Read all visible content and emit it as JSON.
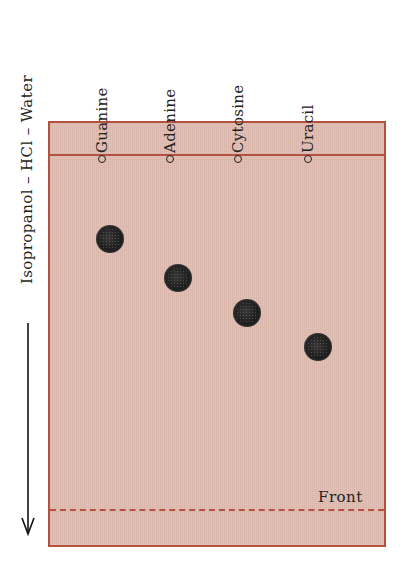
{
  "diagram": {
    "type": "paper chromatography plate",
    "solvent_system": "Isopropanol – HCl – Water",
    "solvent_direction": "down",
    "front_label": "Front",
    "lanes": [
      {
        "name": "Guanine",
        "x": 110,
        "spot_y": 239
      },
      {
        "name": "Adenine",
        "x": 178,
        "spot_y": 278
      },
      {
        "name": "Cytosine",
        "x": 247,
        "spot_y": 313
      },
      {
        "name": "Uracil",
        "x": 318,
        "spot_y": 347
      }
    ],
    "colors": {
      "plate_fill": "#dfbcb0",
      "plate_border": "#b5523f",
      "spot": "#1c1b1b",
      "text": "#222222"
    }
  }
}
